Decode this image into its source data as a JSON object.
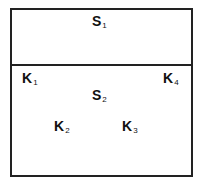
{
  "diagram": {
    "regions": [
      {
        "id": "S1",
        "label": "S",
        "subscript": "1"
      },
      {
        "id": "S2",
        "label": "S",
        "subscript": "2"
      }
    ],
    "points": [
      {
        "id": "K1",
        "label": "K",
        "subscript": "1"
      },
      {
        "id": "K2",
        "label": "K",
        "subscript": "2"
      },
      {
        "id": "K3",
        "label": "K",
        "subscript": "3"
      },
      {
        "id": "K4",
        "label": "K",
        "subscript": "4"
      }
    ]
  }
}
